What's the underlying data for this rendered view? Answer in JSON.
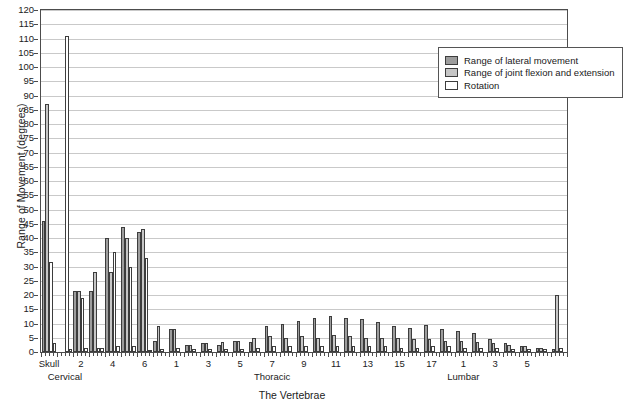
{
  "chart_data": {
    "type": "bar",
    "title": "",
    "xlabel": "The Vertebrae",
    "ylabel": "Range of Movement (degrees)",
    "ylim": [
      0,
      120
    ],
    "ytick_step": 5,
    "yticks": [
      0,
      5,
      10,
      15,
      20,
      25,
      30,
      35,
      40,
      45,
      50,
      55,
      60,
      65,
      70,
      75,
      80,
      85,
      90,
      95,
      100,
      105,
      110,
      115,
      120
    ],
    "grid": "horizontal",
    "legend_position": "top-right",
    "legend": [
      {
        "name": "Range of lateral movement",
        "color": "#9d9d9d"
      },
      {
        "name": "Range of joint flexion and extension",
        "color": "#c6c6c6"
      },
      {
        "name": "Rotation",
        "color": "#ffffff"
      }
    ],
    "series": [
      {
        "name": "Range of lateral movement",
        "values": [
          46,
          0,
          21.5,
          21.5,
          40,
          44,
          42,
          4,
          8,
          2.5,
          3,
          2.5,
          4,
          3.5,
          9,
          10,
          11,
          12,
          12.5,
          12,
          11.5,
          10.5,
          9,
          8.5,
          9.5,
          8,
          7.5,
          6.5,
          4.5,
          3,
          2,
          1.5,
          1
        ]
      },
      {
        "name": "Range of joint flexion and extension",
        "values": [
          87,
          0,
          21.5,
          28,
          28,
          40,
          43,
          9,
          8,
          2.5,
          3,
          3.5,
          4,
          5,
          5.5,
          5,
          5.5,
          5,
          6,
          5.5,
          5,
          5,
          5,
          4.5,
          4.5,
          4,
          4,
          3.5,
          3,
          2.5,
          2,
          1.5,
          20
        ]
      },
      {
        "name": "Rotation",
        "values": [
          31.5,
          111,
          19,
          1.5,
          35,
          30,
          33,
          1,
          1.5,
          1,
          1,
          1,
          1,
          1.5,
          2,
          2,
          2,
          2,
          2,
          2,
          2,
          2,
          1.5,
          1.5,
          2,
          2,
          1.5,
          1.5,
          1.5,
          1,
          1,
          1,
          1.5
        ]
      },
      {
        "name": "small-extra",
        "values": [
          3,
          1,
          1.5,
          1.5,
          2,
          2,
          0.8,
          0,
          0,
          0,
          0,
          0,
          0,
          0,
          0,
          0,
          0,
          0,
          0,
          0,
          0,
          0,
          0,
          0,
          0,
          0,
          0,
          0,
          0,
          0,
          0,
          0,
          0
        ]
      }
    ],
    "groups": [
      {
        "label": "Skull",
        "region": ""
      },
      {
        "label": "",
        "region": "Cervical"
      },
      {
        "label": "2",
        "region": ""
      },
      {
        "label": "",
        "region": ""
      },
      {
        "label": "4",
        "region": ""
      },
      {
        "label": "",
        "region": ""
      },
      {
        "label": "6",
        "region": ""
      },
      {
        "label": "",
        "region": ""
      },
      {
        "label": "1",
        "region": ""
      },
      {
        "label": "",
        "region": ""
      },
      {
        "label": "3",
        "region": ""
      },
      {
        "label": "",
        "region": ""
      },
      {
        "label": "5",
        "region": ""
      },
      {
        "label": "",
        "region": ""
      },
      {
        "label": "7",
        "region": "Thoracic"
      },
      {
        "label": "",
        "region": ""
      },
      {
        "label": "9",
        "region": ""
      },
      {
        "label": "",
        "region": ""
      },
      {
        "label": "11",
        "region": ""
      },
      {
        "label": "",
        "region": ""
      },
      {
        "label": "13",
        "region": ""
      },
      {
        "label": "",
        "region": ""
      },
      {
        "label": "15",
        "region": ""
      },
      {
        "label": "",
        "region": ""
      },
      {
        "label": "17",
        "region": ""
      },
      {
        "label": "",
        "region": ""
      },
      {
        "label": "1",
        "region": "Lumbar"
      },
      {
        "label": "",
        "region": ""
      },
      {
        "label": "3",
        "region": ""
      },
      {
        "label": "",
        "region": ""
      },
      {
        "label": "5",
        "region": ""
      },
      {
        "label": "",
        "region": ""
      },
      {
        "label": "",
        "region": ""
      }
    ],
    "region_labels": [
      "Cervical",
      "Thoracic",
      "Lumbar"
    ]
  }
}
